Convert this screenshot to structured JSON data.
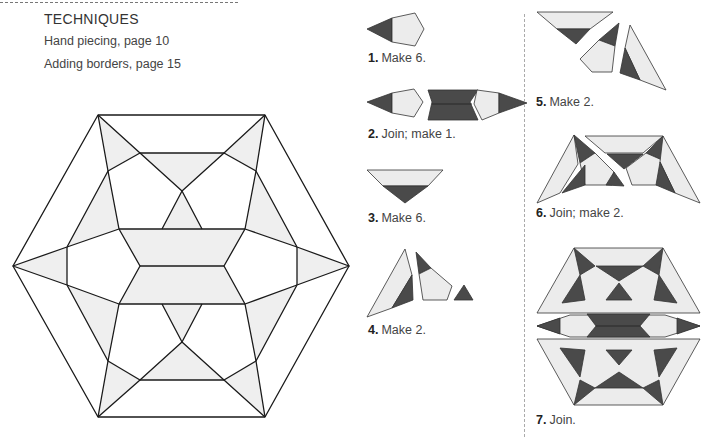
{
  "techniques": {
    "heading": "TECHNIQUES",
    "items": [
      "Hand piecing, page 10",
      "Adding borders, page 15"
    ]
  },
  "steps": [
    {
      "num": "1.",
      "text": "Make 6."
    },
    {
      "num": "2.",
      "text": "Join; make 1."
    },
    {
      "num": "3.",
      "text": "Make 6."
    },
    {
      "num": "4.",
      "text": "Make 2."
    },
    {
      "num": "5.",
      "text": "Make 2."
    },
    {
      "num": "6.",
      "text": "Join; make 2."
    },
    {
      "num": "7.",
      "text": "Join."
    }
  ],
  "colors": {
    "dark": "#4a4a4a",
    "light": "#ececec",
    "line": "#1a1a1a"
  }
}
